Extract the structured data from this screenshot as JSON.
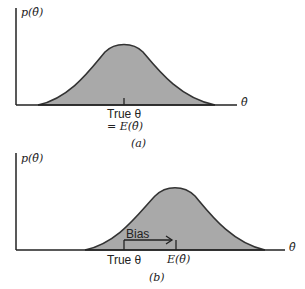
{
  "panels": [
    {
      "id": "a",
      "caption": "(a)",
      "y_label": "p(θ̂)",
      "x_label": "θ̂",
      "marker_label_line1": "True θ",
      "marker_label_line2": "= E(θ̂)"
    },
    {
      "id": "b",
      "caption": "(b)",
      "y_label": "p(θ̂)",
      "x_label": "θ̂",
      "bias_label": "Bias",
      "true_label": "True θ",
      "expectation_label": "E(θ̂)"
    }
  ],
  "colors": {
    "fill": "#a9a9a9",
    "stroke": "#333333",
    "axis": "#222222"
  }
}
